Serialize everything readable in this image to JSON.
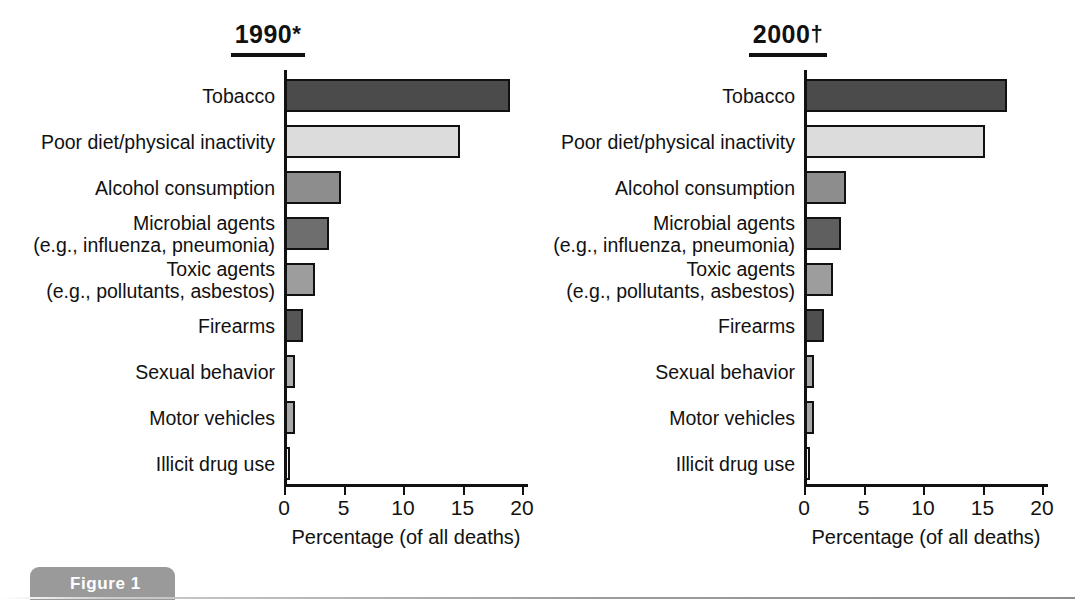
{
  "figure": {
    "tag_label": "Figure 1"
  },
  "panels": [
    {
      "id": "panel-1990",
      "title_text": "1990",
      "title_marker": "*"
    },
    {
      "id": "panel-2000",
      "title_text": "2000",
      "title_marker": "†"
    }
  ],
  "axis": {
    "title": "Percentage (of all deaths)",
    "ticks": [
      "0",
      "5",
      "10",
      "15",
      "20"
    ]
  },
  "chart_data": [
    {
      "type": "bar",
      "orientation": "horizontal",
      "title": "1990*",
      "xlabel": "Percentage (of all deaths)",
      "ylabel": "",
      "xlim": [
        0,
        20
      ],
      "xticks": [
        0,
        5,
        10,
        15,
        20
      ],
      "grid": false,
      "legend": "none",
      "categories": [
        "Tobacco",
        "Poor diet/physical inactivity",
        "Alcohol consumption",
        "Microbial agents\n(e.g., influenza, pneumonia)",
        "Toxic agents\n(e.g., pollutants, asbestos)",
        "Firearms",
        "Sexual behavior",
        "Motor vehicles",
        "Illicit drug use"
      ],
      "values": [
        19.0,
        14.8,
        4.8,
        3.8,
        2.6,
        1.6,
        0.9,
        0.9,
        0.5
      ],
      "bar_colors": [
        "#4b4b4b",
        "#dcdcdc",
        "#8d8d8d",
        "#6e6e6e",
        "#9d9d9d",
        "#565656",
        "#aeaeae",
        "#a8a8a8",
        "#fafafa"
      ]
    },
    {
      "type": "bar",
      "orientation": "horizontal",
      "title": "2000†",
      "xlabel": "Percentage (of all deaths)",
      "ylabel": "",
      "xlim": [
        0,
        20
      ],
      "xticks": [
        0,
        5,
        10,
        15,
        20
      ],
      "grid": false,
      "legend": "none",
      "categories": [
        "Tobacco",
        "Poor diet/physical inactivity",
        "Alcohol consumption",
        "Microbial agents\n(e.g., influenza, pneumonia)",
        "Toxic agents\n(e.g., pollutants, asbestos)",
        "Firearms",
        "Sexual behavior",
        "Motor vehicles",
        "Illicit drug use"
      ],
      "values": [
        17.1,
        15.2,
        3.5,
        3.1,
        2.4,
        1.7,
        0.8,
        0.8,
        0.5
      ],
      "bar_colors": [
        "#4b4b4b",
        "#dcdcdc",
        "#8d8d8d",
        "#5f5f5f",
        "#9d9d9d",
        "#4f4f4f",
        "#a6a6a6",
        "#a6a6a6",
        "#fafafa"
      ]
    }
  ]
}
